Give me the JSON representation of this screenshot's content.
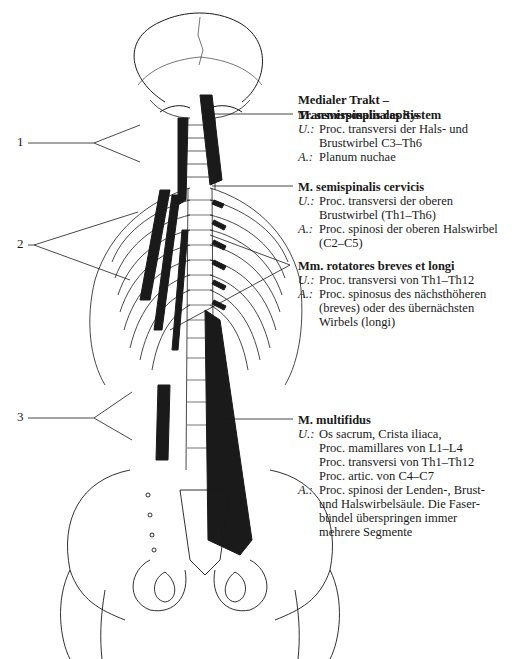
{
  "title": {
    "line1": "Medialer Trakt –",
    "line2": "Transversospinales System"
  },
  "labels": [
    "1",
    "2",
    "3"
  ],
  "muscles": [
    {
      "name": "M. semispinalis capitis",
      "origin_key": "U.:",
      "origin": [
        "Proc. transversi der Hals- und",
        "Brustwirbel C3–Th6"
      ],
      "insertion_key": "A.:",
      "insertion": [
        "Planum nuchae"
      ]
    },
    {
      "name": "M. semispinalis cervicis",
      "origin_key": "U.:",
      "origin": [
        "Proc. transversi der oberen",
        "Brustwirbel (Th1–Th6)"
      ],
      "insertion_key": "A.:",
      "insertion": [
        "Proc. spinosi der oberen Halswirbel",
        "(C2–C5)"
      ]
    },
    {
      "name": "Mm. rotatores breves et longi",
      "origin_key": "U.:",
      "origin": [
        "Proc. transversi von Th1–Th12"
      ],
      "insertion_key": "A.:",
      "insertion": [
        "Proc. spinosus des nächsthöheren",
        "(breves) oder des übernächsten",
        "Wirbels (longi)"
      ]
    },
    {
      "name": "M. multifidus",
      "origin_key": "U.:",
      "origin": [
        "Os sacrum, Crista iliaca,",
        "Proc. mamillares von L1–L4",
        "Proc. transversi von Th1–Th12",
        "Proc. artic. von C4–C7"
      ],
      "insertion_key": "A.:",
      "insertion": [
        "Proc. spinosi der Lenden-, Brust-",
        "und Halswirbelsäule. Die Faser-",
        "bündel überspringen immer",
        "mehrere Segmente"
      ]
    }
  ],
  "colors": {
    "ink": "#1a1a1a",
    "paper": "#ffffff"
  }
}
